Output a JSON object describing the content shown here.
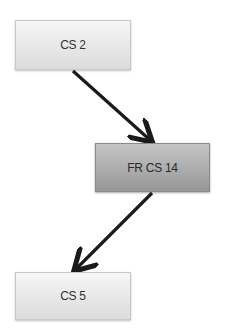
{
  "diagram": {
    "type": "flow",
    "nodes": [
      {
        "id": "n1",
        "label": "CS 2",
        "style": "light"
      },
      {
        "id": "n2",
        "label": "FR CS 14",
        "style": "dark"
      },
      {
        "id": "n3",
        "label": "CS 5",
        "style": "light"
      }
    ],
    "edges": [
      {
        "from": "n1",
        "to": "n2"
      },
      {
        "from": "n2",
        "to": "n3"
      }
    ],
    "colors": {
      "node_light": "#e6e6e6",
      "node_dark": "#acacac",
      "arrow": "#1a1a1a",
      "text": "#333333"
    }
  }
}
